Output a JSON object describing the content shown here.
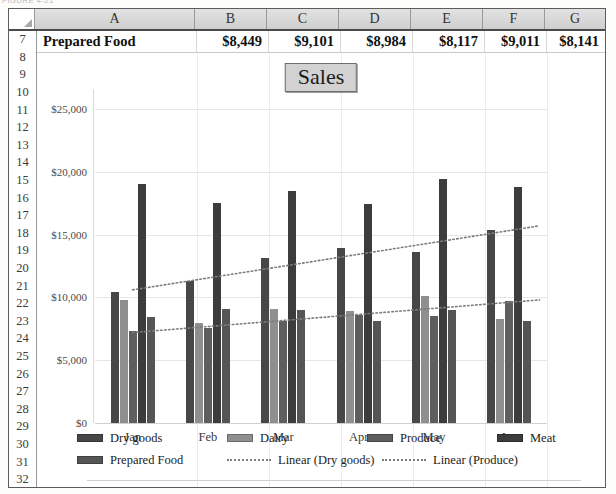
{
  "page": {
    "caption_fragment": "FIGURE 4-21"
  },
  "sheet": {
    "column_headers": [
      "A",
      "B",
      "C",
      "D",
      "E",
      "F",
      "G"
    ],
    "row_numbers": [
      "7",
      "8",
      "9",
      "10",
      "11",
      "12",
      "13",
      "14",
      "15",
      "16",
      "17",
      "18",
      "19",
      "20",
      "21",
      "22",
      "23",
      "24",
      "25",
      "26",
      "27",
      "28",
      "29",
      "30",
      "31",
      "32"
    ],
    "data_row": {
      "row_number": "7",
      "label": "Prepared Food",
      "values": [
        "$8,449",
        "$9,101",
        "$8,984",
        "$8,117",
        "$9,011",
        "$8,141"
      ]
    }
  },
  "chart_data": {
    "type": "bar",
    "title": "Sales",
    "xlabel": "",
    "ylabel": "",
    "categories": [
      "Jan",
      "Feb",
      "Mar",
      "Apr",
      "May",
      "Jun"
    ],
    "ylim": [
      0,
      25000
    ],
    "yticks": [
      0,
      5000,
      10000,
      15000,
      20000,
      25000
    ],
    "ytick_labels": [
      "$0",
      "$5,000",
      "$10,000",
      "$15,000",
      "$20,000",
      "$25,000"
    ],
    "grid": true,
    "legend_position": "bottom",
    "series": [
      {
        "name": "Dry goods",
        "color": "#474747",
        "values": [
          10400,
          11300,
          13100,
          13900,
          13600,
          15400
        ]
      },
      {
        "name": "Dairy",
        "color": "#8f8f8f",
        "values": [
          9800,
          8000,
          9100,
          8900,
          10100,
          8300
        ]
      },
      {
        "name": "Produce",
        "color": "#5e5e5e",
        "values": [
          7300,
          7600,
          8100,
          8600,
          8500,
          9700
        ]
      },
      {
        "name": "Meat",
        "color": "#3c3c3c",
        "values": [
          19000,
          17500,
          18500,
          17400,
          19400,
          18800
        ]
      },
      {
        "name": "Prepared Food",
        "color": "#555555",
        "values": [
          8449,
          9101,
          8984,
          8117,
          9011,
          8141
        ]
      }
    ],
    "trendlines": [
      {
        "name": "Linear (Dry goods)",
        "style": "dotted",
        "color": "#7d7d7d",
        "start": 10600,
        "end": 15700
      },
      {
        "name": "Linear (Produce)",
        "style": "dotted",
        "color": "#7d7d7d",
        "start": 7200,
        "end": 9800
      }
    ],
    "legend_entries": [
      {
        "label": "Dry goods",
        "kind": "swatch",
        "color": "#474747"
      },
      {
        "label": "Dairy",
        "kind": "swatch",
        "color": "#8f8f8f"
      },
      {
        "label": "Produce",
        "kind": "swatch",
        "color": "#5e5e5e"
      },
      {
        "label": "Meat",
        "kind": "swatch",
        "color": "#3c3c3c"
      },
      {
        "label": "Prepared Food",
        "kind": "swatch",
        "color": "#555555"
      },
      {
        "label": "Linear (Dry goods)",
        "kind": "line",
        "color": "#7d7d7d"
      },
      {
        "label": "Linear (Produce)",
        "kind": "line",
        "color": "#7d7d7d"
      }
    ]
  }
}
